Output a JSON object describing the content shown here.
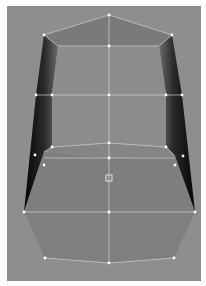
{
  "viewport": {
    "background": "#8e8e8e",
    "view": "front",
    "mesh": {
      "type": "polygon-mesh",
      "selection_mode": "vertex",
      "colors": {
        "face_light": "#8b8b8b",
        "face_top": "#7a7a7a",
        "face_bottom": "#7f7f7f",
        "side_dark": "#0a0a0a",
        "side_mid": "#4a4a4a",
        "edge": "#d8d8d8",
        "vertex": "#ffffff"
      },
      "pivot": {
        "x": 109,
        "y": 178
      }
    }
  }
}
